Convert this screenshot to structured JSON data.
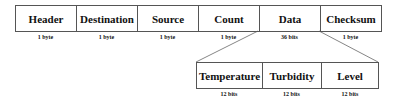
{
  "packet": {
    "fields": [
      {
        "name": "Header",
        "size": "1 byte"
      },
      {
        "name": "Destination",
        "size": "1 byte"
      },
      {
        "name": "Source",
        "size": "1 byte"
      },
      {
        "name": "Count",
        "size": "1 byte"
      },
      {
        "name": "Data",
        "size": "36 bits"
      },
      {
        "name": "Checksum",
        "size": "1 byte"
      }
    ]
  },
  "data_breakdown": {
    "fields": [
      {
        "name": "Temperature",
        "size": "12 bits"
      },
      {
        "name": "Turbidity",
        "size": "12 bits"
      },
      {
        "name": "Level",
        "size": "12 bits"
      }
    ]
  }
}
